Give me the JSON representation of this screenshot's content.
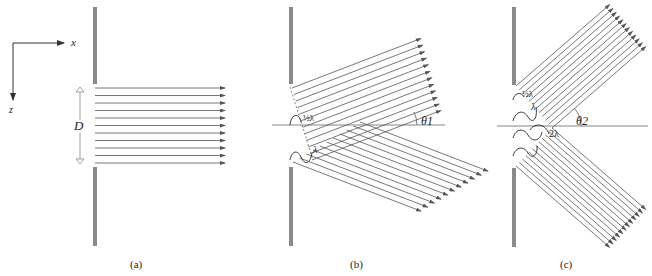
{
  "colors": {
    "wall": "#8a8a8a",
    "ray": "#555555",
    "axis": "#555555",
    "wave": "#222222"
  },
  "axes": {
    "x_label": "x",
    "z_label": "z"
  },
  "panels": [
    {
      "id": "a",
      "caption": "(a)",
      "aperture_label": "D",
      "wall_x": 93,
      "wall_top": [
        7,
        84
      ],
      "wall_bottom": [
        167,
        246
      ],
      "beams": [
        {
          "count": 11,
          "start": [
            [
              95,
              88
            ],
            [
              95,
              163
            ]
          ],
          "angle_deg": 0,
          "length": 130
        }
      ]
    },
    {
      "id": "b",
      "caption": "(b)",
      "angle_label": "θ1",
      "path_labels": [
        "½λ",
        "λ"
      ],
      "wall_x": 289,
      "wall_top": [
        7,
        84
      ],
      "wall_bottom": [
        167,
        246
      ],
      "axis_y": 125,
      "axis_x": [
        272,
        445
      ],
      "beams": [
        {
          "count": 12,
          "start": [
            [
              292,
              88
            ],
            [
              312,
              160
            ]
          ],
          "angle_deg": -21,
          "length": 138
        },
        {
          "count": 11,
          "start": [
            [
              360,
              122
            ],
            [
              293,
              162
            ]
          ],
          "angle_deg": 21,
          "length": 137
        }
      ]
    },
    {
      "id": "c",
      "caption": "(c)",
      "angle_label": "θ2",
      "path_labels": [
        "½λ",
        "λ",
        "2λ"
      ],
      "wall_x": 512,
      "wall_top": [
        7,
        85
      ],
      "wall_bottom": [
        168,
        247
      ],
      "axis_y": 126,
      "axis_x": [
        497,
        648
      ],
      "beams": [
        {
          "count": 12,
          "start": [
            [
              516,
              86
            ],
            [
              552,
              128
            ]
          ],
          "angle_deg": -41,
          "length": 124
        },
        {
          "count": 12,
          "start": [
            [
              552,
              128
            ],
            [
              516,
              166
            ]
          ],
          "angle_deg": 41,
          "length": 124
        }
      ]
    }
  ]
}
